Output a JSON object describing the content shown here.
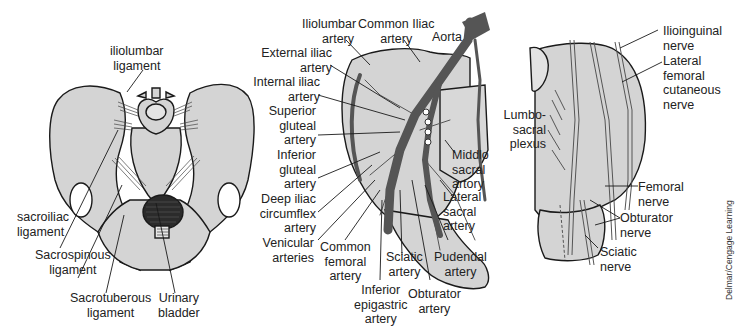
{
  "figures": {
    "pelvis_ligaments": {
      "labels": {
        "iliolumbar_ligament": "iliolumbar\nligament",
        "sacroiliac_ligament": "sacroiliac\nligament",
        "sacrospinous_ligament": "Sacrospinous\nligament",
        "sacrotuberous_ligament": "Sacrotuberous\nligament",
        "urinary_bladder": "Urinary\nbladder"
      }
    },
    "pelvis_arteries": {
      "labels": {
        "iliolumbar_artery": "Iliolumbar\nartery",
        "common_iliac_artery": "Common Iliac\nartery",
        "aorta": "Aorta",
        "external_iliac_artery": "External iliac\nartery",
        "internal_iliac_artery": "Internal iliac\nartery",
        "superior_gluteal_artery": "Superior\ngluteal\nartery",
        "inferior_gluteal_artery": "Inferior\ngluteal\nartery",
        "deep_iliac_circumflex_artery": "Deep iliac\ncircumflex\nartery",
        "venicular_arteries": "Venicular\narteries",
        "common_femoral_artery": "Common\nfemoral\nartery",
        "inferior_epigastric_artery": "Inferior\nepigastric\nartery",
        "sciatic_artery": "Sciatic\nartery",
        "obturator_artery": "Obturator\nartery",
        "pudendal_artery": "Pudendal\nartery",
        "lateral_sacral_artery": "Lateral\nsacral\nartery",
        "middle_sacral_artery": "Middlo\nsacral\nartory"
      }
    },
    "pelvis_nerves": {
      "labels": {
        "ilioinguinal_nerve": "Ilioinguinal\nnerve",
        "lateral_femoral_cutaneous_nerve": "Lateral\nfemoral\ncutaneous\nnerve",
        "lumbosacral_plexus": "Lumbo-\nsacral\nplexus",
        "femoral_nerve": "Femoral\nnerve",
        "obturator_nerve": "Obturator\nnerve",
        "sciatic_nerve": "Sciatic\nnerve"
      }
    }
  },
  "credit": "Delmar/Cengage Learning",
  "colors": {
    "bone_fill": "#d4d4d4",
    "outline": "#1a1a1a",
    "artery": "#555555",
    "bladder": "#2b2b2b",
    "background": "#ffffff"
  }
}
